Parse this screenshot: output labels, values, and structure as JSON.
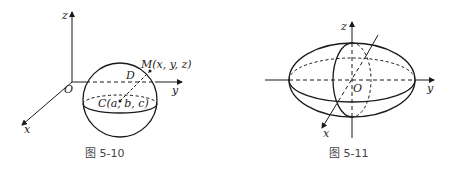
{
  "figures": [
    {
      "caption": "图 5-10",
      "labels": {
        "z": "z",
        "y": "y",
        "x": "x",
        "origin": "O",
        "point_m": "M(x, y, z)",
        "point_d": "D",
        "center": "C(a, b, c)"
      },
      "shape": "sphere"
    },
    {
      "caption": "图 5-11",
      "labels": {
        "z": "z",
        "y": "y",
        "x": "x",
        "origin": "O"
      },
      "shape": "ellipsoid"
    }
  ],
  "colors": {
    "stroke": "#1a1a1a",
    "caption": "#444444"
  }
}
